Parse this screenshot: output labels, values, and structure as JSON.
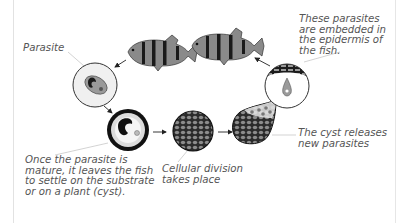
{
  "labels": {
    "parasite": "Parasite",
    "embedded": "These parasites are embedded in the epidermis of the fish.",
    "mature": "Once the parasite is mature, it leaves the fish to settle on the substrate or on a plant (cyst).",
    "division": "Cellular division takes place",
    "cyst_release": "The cyst releases new parasites"
  },
  "stages": [
    {
      "id": "fish",
      "description": "Two striped fish (host)"
    },
    {
      "id": "parasite",
      "description": "Free parasite in circle"
    },
    {
      "id": "mature-cyst",
      "description": "Mature parasite leaving fish, forming cyst"
    },
    {
      "id": "cellular-division",
      "description": "Cyst undergoing cellular division"
    },
    {
      "id": "cyst-release",
      "description": "Cyst releasing new parasites"
    },
    {
      "id": "epidermis",
      "description": "Parasite embedded in fish epidermis"
    }
  ],
  "colors": {
    "text": "#555555",
    "line": "#c8c8c8",
    "fish_body": "#8a8a8a",
    "stripe": "#1a1a1a",
    "circle_fill": "#f2f2f2",
    "dark": "#111111"
  }
}
